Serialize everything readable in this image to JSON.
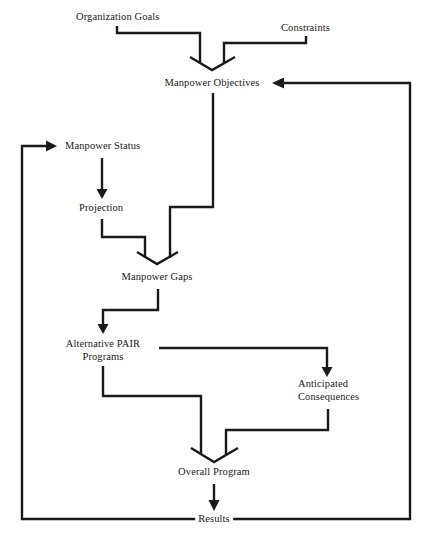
{
  "diagram": {
    "type": "flowchart",
    "line_color": "#1a1a1a",
    "background": "#ffffff",
    "nodes": {
      "organization_goals": "Organization Goals",
      "constraints": "Constraints",
      "manpower_objectives": "Manpower Objectives",
      "manpower_status": "Manpower Status",
      "projection": "Projection",
      "manpower_gaps": "Manpower Gaps",
      "alternative_pair_line1": "Alternative PAIR",
      "alternative_pair_line2": "Programs",
      "anticipated_line1": "Anticipated",
      "anticipated_line2": "Consequences",
      "overall_program": "Overall Program",
      "results": "Results"
    },
    "edges": [
      {
        "from": "Organization Goals",
        "to": "Manpower Objectives",
        "style": "merge"
      },
      {
        "from": "Constraints",
        "to": "Manpower Objectives",
        "style": "merge"
      },
      {
        "from": "Manpower Objectives",
        "to": "Manpower Gaps",
        "style": "merge"
      },
      {
        "from": "Manpower Status",
        "to": "Projection",
        "style": "arrow"
      },
      {
        "from": "Projection",
        "to": "Manpower Gaps",
        "style": "merge"
      },
      {
        "from": "Manpower Gaps",
        "to": "Alternative PAIR Programs",
        "style": "arrow"
      },
      {
        "from": "Alternative PAIR Programs",
        "to": "Anticipated Consequences",
        "style": "arrow"
      },
      {
        "from": "Alternative PAIR Programs",
        "to": "Overall Program",
        "style": "merge"
      },
      {
        "from": "Anticipated Consequences",
        "to": "Overall Program",
        "style": "merge"
      },
      {
        "from": "Overall Program",
        "to": "Results",
        "style": "arrow"
      },
      {
        "from": "Results",
        "to": "Manpower Status",
        "style": "feedback-arrow"
      },
      {
        "from": "Results",
        "to": "Manpower Objectives",
        "style": "feedback-arrow"
      }
    ]
  }
}
